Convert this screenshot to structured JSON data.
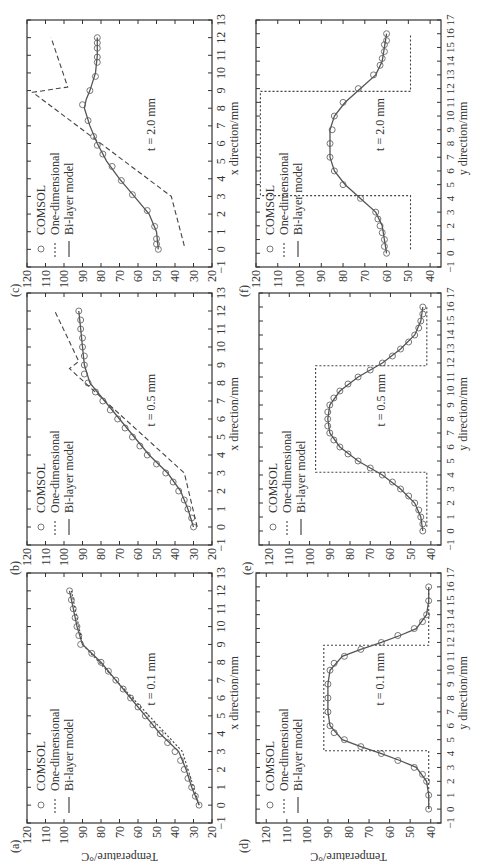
{
  "figure": {
    "y_label": "Temperature/°C",
    "legend": [
      "COMSOL",
      "One-dimensional",
      "Bi-layer model"
    ],
    "colors": {
      "axis": "#333333",
      "comsol": "#777777",
      "one_dim": "#444444",
      "bilayer": "#555555"
    }
  },
  "chart_data": [
    {
      "id": "a",
      "panel_label": "(a)",
      "type": "line",
      "annotation": "t = 0.1 mm",
      "xlabel": "x direction/mm",
      "ylabel": "Temperature/°C",
      "xlim": [
        -1,
        13
      ],
      "ylim": [
        20,
        120
      ],
      "xticks": [
        -1,
        0,
        1,
        2,
        3,
        4,
        5,
        6,
        7,
        8,
        9,
        10,
        11,
        12,
        13
      ],
      "yticks": [
        20,
        30,
        40,
        50,
        60,
        70,
        80,
        90,
        100,
        110,
        120
      ],
      "series": [
        {
          "name": "COMSOL",
          "style": "markers",
          "x": [
            0,
            0.5,
            1,
            1.5,
            2,
            2.5,
            3,
            3.5,
            4,
            4.5,
            5,
            5.5,
            6,
            6.5,
            7,
            7.5,
            8,
            8.5,
            9,
            9.5,
            10,
            10.5,
            11,
            11.5,
            12
          ],
          "y": [
            27,
            29,
            31,
            33,
            35,
            37,
            40,
            44,
            48,
            52,
            56,
            60,
            64,
            68,
            72,
            76,
            80,
            85,
            91,
            92,
            93,
            94,
            95,
            96,
            97
          ]
        },
        {
          "name": "One-dimensional",
          "style": "dotted",
          "x": [
            0,
            3,
            9,
            12
          ],
          "y": [
            27,
            36,
            90,
            96
          ]
        },
        {
          "name": "Bi-layer model",
          "style": "solid",
          "x": [
            0,
            1,
            2,
            3,
            4,
            5,
            6,
            7,
            8,
            9,
            10,
            11,
            12
          ],
          "y": [
            27,
            31,
            34,
            38,
            48,
            56,
            64,
            72,
            80,
            90,
            93,
            95,
            97
          ]
        }
      ]
    },
    {
      "id": "b",
      "panel_label": "(b)",
      "type": "line",
      "annotation": "t = 0.5 mm",
      "xlabel": "x direction/mm",
      "ylabel": "Temperature/°C",
      "xlim": [
        -1,
        13
      ],
      "ylim": [
        20,
        120
      ],
      "xticks": [
        -1,
        0,
        1,
        2,
        3,
        4,
        5,
        6,
        7,
        8,
        9,
        10,
        11,
        12,
        13
      ],
      "yticks": [
        20,
        30,
        40,
        50,
        60,
        70,
        80,
        90,
        100,
        110,
        120
      ],
      "series": [
        {
          "name": "COMSOL",
          "style": "markers",
          "x": [
            0,
            0.5,
            1,
            1.5,
            2,
            2.5,
            3,
            3.5,
            4,
            4.5,
            5,
            5.5,
            6,
            6.5,
            7,
            7.5,
            8,
            8.5,
            9,
            9.5,
            10,
            10.5,
            11,
            11.5,
            12
          ],
          "y": [
            30,
            31,
            33,
            35,
            38,
            41,
            45,
            50,
            55,
            59,
            63,
            67,
            71,
            75,
            79,
            83,
            87,
            89,
            89,
            89,
            90,
            90,
            91,
            91,
            92
          ]
        },
        {
          "name": "One-dimensional",
          "style": "dashed",
          "x": [
            0,
            3,
            8.8,
            9.2,
            12
          ],
          "y": [
            28,
            35,
            97,
            92,
            105
          ]
        },
        {
          "name": "Bi-layer model",
          "style": "solid",
          "x": [
            0,
            1,
            2,
            3,
            4,
            5,
            6,
            7,
            8,
            9,
            10,
            11,
            12
          ],
          "y": [
            30,
            33,
            37,
            44,
            54,
            62,
            70,
            78,
            86,
            89,
            90,
            91,
            92
          ]
        }
      ]
    },
    {
      "id": "c",
      "panel_label": "(c)",
      "type": "line",
      "annotation": "t = 2.0 mm",
      "xlabel": "x direction/mm",
      "ylabel": "Temperature/°C",
      "xlim": [
        -1,
        13
      ],
      "ylim": [
        20,
        120
      ],
      "xticks": [
        -1,
        0,
        1,
        2,
        3,
        4,
        5,
        6,
        7,
        8,
        9,
        10,
        11,
        12,
        13
      ],
      "yticks": [
        20,
        30,
        40,
        50,
        60,
        70,
        80,
        90,
        100,
        110,
        120
      ],
      "series": [
        {
          "name": "COMSOL",
          "style": "markers",
          "x": [
            0,
            0.3,
            0.6,
            1.3,
            2.2,
            3.1,
            3.9,
            4.7,
            5.4,
            5.9,
            6.4,
            7.3,
            8.2,
            9,
            9.8,
            10.6,
            10.9,
            11.4,
            11.7,
            12
          ],
          "y": [
            49,
            50,
            50,
            51,
            55,
            63,
            69,
            74,
            79,
            82,
            84,
            87,
            90,
            86,
            83,
            82,
            82,
            82,
            82,
            82
          ]
        },
        {
          "name": "One-dimensional",
          "style": "dashed",
          "x": [
            0.2,
            3,
            8.9,
            9.2,
            12
          ],
          "y": [
            35,
            42,
            117,
            98,
            107
          ]
        },
        {
          "name": "Bi-layer model",
          "style": "solid",
          "x": [
            0,
            1,
            2,
            3,
            4,
            5,
            6,
            7,
            8,
            8.5,
            9,
            10,
            11,
            12
          ],
          "y": [
            49,
            50,
            54,
            62,
            70,
            77,
            82,
            86,
            89,
            88,
            86,
            83,
            82,
            82
          ]
        }
      ]
    },
    {
      "id": "d",
      "panel_label": "(d)",
      "type": "line",
      "annotation": "t = 0.1 mm",
      "xlabel": "y direction/mm",
      "ylabel": "Temperature/°C",
      "xlim": [
        -1,
        17
      ],
      "ylim": [
        35,
        125
      ],
      "xticks": [
        -1,
        0,
        1,
        2,
        3,
        4,
        5,
        6,
        7,
        8,
        9,
        10,
        11,
        12,
        13,
        14,
        15,
        16,
        17
      ],
      "yticks": [
        40,
        50,
        60,
        70,
        80,
        90,
        100,
        110,
        120
      ],
      "series": [
        {
          "name": "COMSOL",
          "style": "markers",
          "x": [
            0,
            1,
            2,
            2.5,
            3,
            3.5,
            4,
            4.5,
            5,
            5.5,
            6,
            7,
            8,
            9,
            10,
            10.5,
            11,
            11.5,
            12,
            12.5,
            13,
            13.5,
            14,
            15,
            16
          ],
          "y": [
            41,
            41,
            42,
            44,
            48,
            56,
            64,
            74,
            82,
            87,
            89,
            90,
            90,
            90,
            89,
            87,
            82,
            74,
            64,
            56,
            48,
            44,
            42,
            41,
            41
          ]
        },
        {
          "name": "One-dimensional",
          "style": "dotted",
          "x": [
            0,
            3.8,
            3.8,
            4.2,
            4.2,
            11.8,
            11.8,
            12.2,
            12.2,
            16
          ],
          "y": [
            41,
            41,
            41,
            41,
            92,
            92,
            41,
            41,
            41,
            41
          ]
        },
        {
          "name": "Bi-layer model",
          "style": "solid",
          "x": [
            0,
            1,
            2,
            3,
            3.5,
            4,
            4.5,
            5,
            6,
            7,
            8,
            9,
            10,
            11,
            11.5,
            12,
            12.5,
            13,
            14,
            15,
            16
          ],
          "y": [
            41,
            41,
            42,
            47,
            55,
            64,
            74,
            83,
            89,
            90,
            90,
            90,
            89,
            83,
            74,
            64,
            55,
            47,
            42,
            41,
            41
          ]
        }
      ]
    },
    {
      "id": "e",
      "panel_label": "(e)",
      "type": "line",
      "annotation": "t = 0.5 mm",
      "xlabel": "y direction/mm",
      "ylabel": "Temperature/°C",
      "xlim": [
        -1,
        17
      ],
      "ylim": [
        35,
        125
      ],
      "xticks": [
        -1,
        0,
        1,
        2,
        3,
        4,
        5,
        6,
        7,
        8,
        9,
        10,
        11,
        12,
        13,
        14,
        15,
        16,
        17
      ],
      "yticks": [
        40,
        50,
        60,
        70,
        80,
        90,
        100,
        110,
        120
      ],
      "series": [
        {
          "name": "COMSOL",
          "style": "markers",
          "x": [
            0,
            0.5,
            1,
            1.5,
            2,
            2.5,
            3,
            3.5,
            4,
            4.5,
            5,
            5.5,
            6,
            6.5,
            7,
            7.5,
            8,
            8.5,
            9,
            9.5,
            10,
            10.5,
            11,
            11.5,
            12,
            12.5,
            13,
            13.5,
            14,
            14.5,
            15,
            15.5,
            16
          ],
          "y": [
            44,
            44,
            45,
            46,
            48,
            51,
            55,
            59,
            64,
            70,
            76,
            81,
            85,
            88,
            90,
            91,
            91,
            91,
            90,
            88,
            85,
            81,
            76,
            70,
            64,
            59,
            55,
            51,
            48,
            46,
            45,
            44,
            44
          ]
        },
        {
          "name": "One-dimensional",
          "style": "dotted",
          "x": [
            0.3,
            3.8,
            3.8,
            4.2,
            4.2,
            11.8,
            11.8,
            12.2,
            12.2,
            16
          ],
          "y": [
            42,
            42,
            42,
            42,
            97,
            97,
            42,
            42,
            42,
            42
          ]
        },
        {
          "name": "Bi-layer model",
          "style": "solid",
          "x": [
            0,
            1,
            2,
            3,
            4,
            5,
            6,
            7,
            8,
            9,
            10,
            11,
            12,
            13,
            14,
            15,
            16
          ],
          "y": [
            44,
            45,
            48,
            55,
            64,
            76,
            85,
            90,
            91,
            90,
            85,
            76,
            64,
            55,
            48,
            45,
            44
          ]
        }
      ]
    },
    {
      "id": "f",
      "panel_label": "(f)",
      "type": "line",
      "annotation": "t = 2.0 mm",
      "xlabel": "y direction/mm",
      "ylabel": "Temperature/°C",
      "xlim": [
        -1,
        17
      ],
      "ylim": [
        35,
        120
      ],
      "xticks": [
        -1,
        0,
        1,
        2,
        3,
        4,
        5,
        6,
        7,
        8,
        9,
        10,
        11,
        12,
        13,
        14,
        15,
        16,
        17
      ],
      "yticks": [
        40,
        50,
        60,
        70,
        80,
        90,
        100,
        110,
        120
      ],
      "series": [
        {
          "name": "COMSOL",
          "style": "markers",
          "x": [
            0,
            0.5,
            1,
            1.5,
            2,
            2.5,
            3,
            4,
            5,
            6,
            7,
            8,
            9,
            10,
            11,
            12,
            13,
            13.7,
            14.2,
            14.7,
            15.2,
            15.5,
            16
          ],
          "y": [
            60,
            61,
            61,
            62,
            63,
            64,
            65,
            72,
            80,
            84,
            86,
            86,
            85,
            84,
            80,
            73,
            66,
            63,
            62,
            61,
            61,
            60,
            60
          ]
        },
        {
          "name": "One-dimensional",
          "style": "dotted",
          "x": [
            0.3,
            3.8,
            3.8,
            4.2,
            4.2,
            11.8,
            11.8,
            12.2,
            12.2,
            16
          ],
          "y": [
            49,
            49,
            49,
            49,
            118,
            118,
            49,
            49,
            49,
            49
          ]
        },
        {
          "name": "Bi-layer model",
          "style": "solid",
          "x": [
            0,
            1,
            2,
            3,
            4,
            5,
            6,
            7,
            8,
            9,
            10,
            11,
            12,
            13,
            14,
            15,
            16
          ],
          "y": [
            60,
            61,
            62,
            65,
            72,
            79,
            84,
            86,
            86,
            86,
            84,
            79,
            72,
            65,
            62,
            61,
            60
          ]
        }
      ]
    }
  ]
}
